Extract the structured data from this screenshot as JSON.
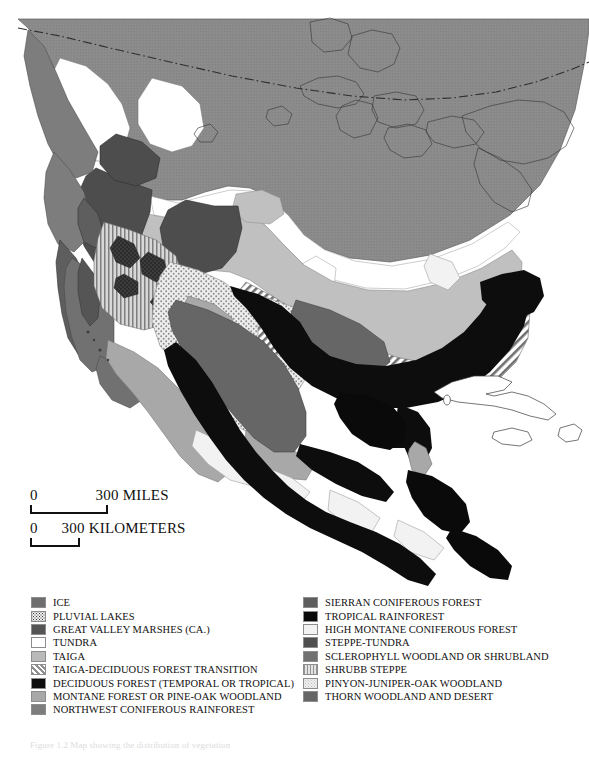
{
  "figure": {
    "caption": "Figure 1.2 Map showing the distribution of vegetation"
  },
  "scale": {
    "miles": {
      "zero": "0",
      "value": "300",
      "unit": "MILES"
    },
    "kilometers": {
      "zero": "0",
      "value": "300",
      "unit": "KILOMETERS"
    }
  },
  "legend": {
    "left": [
      {
        "label": "ICE",
        "color": "#6e6e6e",
        "pattern": "solid",
        "swatch_name": "ice"
      },
      {
        "label": "PLUVIAL LAKES",
        "color": "#3a3a3a",
        "pattern": "stipple",
        "swatch_name": "pluvial-lakes"
      },
      {
        "label": "GREAT VALLEY MARSHES (CA.)",
        "color": "#555555",
        "pattern": "solid",
        "swatch_name": "great-valley-marshes"
      },
      {
        "label": "TUNDRA",
        "color": "#ffffff",
        "pattern": "solid",
        "swatch_name": "tundra"
      },
      {
        "label": "TAIGA",
        "color": "#b9b9b9",
        "pattern": "solid",
        "swatch_name": "taiga"
      },
      {
        "label": "TAIGA-DECIDUOUS FOREST TRANSITION",
        "color": "#8f8f8f",
        "pattern": "diagonal",
        "swatch_name": "taiga-deciduous-transition"
      },
      {
        "label": "DECIDUOUS FOREST (TEMPORAL OR TROPICAL)",
        "color": "#0d0d0d",
        "pattern": "solid",
        "swatch_name": "deciduous-forest"
      },
      {
        "label": "MONTANE FOREST OR PINE-OAK WOODLAND",
        "color": "#a8a8a8",
        "pattern": "solid",
        "swatch_name": "montane-forest"
      },
      {
        "label": "NORTHWEST CONIFEROUS RAINFOREST",
        "color": "#7d7d7d",
        "pattern": "solid",
        "swatch_name": "northwest-coniferous-rainforest"
      }
    ],
    "right": [
      {
        "label": "SIERRAN CONIFEROUS FOREST",
        "color": "#5e5e5e",
        "pattern": "solid",
        "swatch_name": "sierran-coniferous-forest"
      },
      {
        "label": "TROPICAL RAINFOREST",
        "color": "#0a0a0a",
        "pattern": "solid",
        "swatch_name": "tropical-rainforest"
      },
      {
        "label": "HIGH MONTANE CONIFEROUS FOREST",
        "color": "#f2f2f2",
        "pattern": "solid",
        "swatch_name": "high-montane-coniferous-forest"
      },
      {
        "label": "STEPPE-TUNDRA",
        "color": "#4f4f4f",
        "pattern": "solid",
        "swatch_name": "steppe-tundra"
      },
      {
        "label": "SCLEROPHYLL WOODLAND OR SHRUBLAND",
        "color": "#717171",
        "pattern": "solid",
        "swatch_name": "sclerophyll-woodland"
      },
      {
        "label": "SHRUBB STEPPE",
        "color": "#959595",
        "pattern": "vertical",
        "swatch_name": "shrub-steppe"
      },
      {
        "label": "PINYON-JUNIPER-OAK WOODLAND",
        "color": "#c4c4c4",
        "pattern": "stipple",
        "swatch_name": "pinyon-juniper-oak-woodland"
      },
      {
        "label": "THORN WOODLAND AND DESERT",
        "color": "#666666",
        "pattern": "solid",
        "swatch_name": "thorn-woodland-desert"
      }
    ]
  }
}
